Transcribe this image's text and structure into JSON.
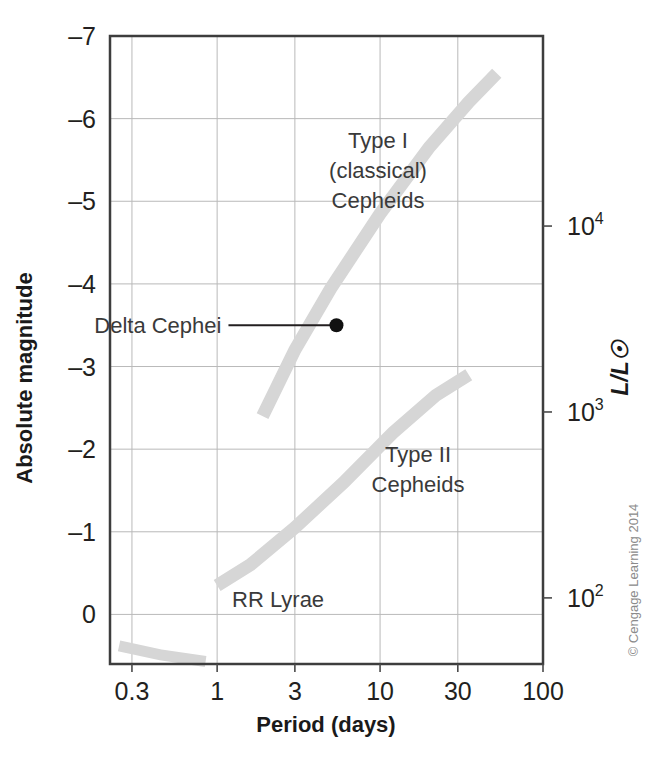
{
  "figure": {
    "credit": "© Cengage Learning 2014"
  },
  "chart_data": {
    "type": "line",
    "title": "",
    "xlabel": "Period (days)",
    "ylabel": "Absolute magnitude",
    "y2label": "L/L☉",
    "xscale": "log",
    "xlim": [
      0.22,
      100
    ],
    "ylim": [
      0.6,
      -7
    ],
    "grid": true,
    "legend_position": "inline-annotations",
    "xticks": [
      "0.3",
      "1",
      "3",
      "10",
      "30",
      "100"
    ],
    "xtick_values": [
      0.3,
      1,
      3,
      10,
      30,
      100
    ],
    "yticks": [
      "-7",
      "-6",
      "-5",
      "-4",
      "-3",
      "-2",
      "-1",
      "0"
    ],
    "ytick_values": [
      -7,
      -6,
      -5,
      -4,
      -3,
      -2,
      -1,
      0
    ],
    "y2ticks": [
      "10",
      "10",
      "10"
    ],
    "y2tick_exponents": [
      "4",
      "3",
      "2"
    ],
    "y2tick_values": [
      10000,
      1000,
      100
    ],
    "y2tick_magnitudes": [
      -4.7,
      -2.45,
      -0.2
    ],
    "series": [
      {
        "name": "Type I (classical) Cepheids",
        "annotation_lines": [
          "Type I",
          "(classical)",
          "Cepheids"
        ],
        "band": true,
        "period_range": [
          1.9,
          52
        ],
        "magnitude_range": [
          -2.4,
          -6.55
        ],
        "points": [
          {
            "period": 1.9,
            "magnitude": -2.4
          },
          {
            "period": 3.0,
            "magnitude": -3.2
          },
          {
            "period": 5.0,
            "magnitude": -3.95
          },
          {
            "period": 10.0,
            "magnitude": -4.85
          },
          {
            "period": 20.0,
            "magnitude": -5.65
          },
          {
            "period": 35.0,
            "magnitude": -6.2
          },
          {
            "period": 52.0,
            "magnitude": -6.55
          }
        ]
      },
      {
        "name": "Type II Cepheids",
        "annotation_lines": [
          "Type II",
          "Cepheids"
        ],
        "band": true,
        "period_range": [
          1.0,
          35
        ],
        "magnitude_range": [
          -0.35,
          -2.9
        ],
        "points": [
          {
            "period": 1.0,
            "magnitude": -0.35
          },
          {
            "period": 1.6,
            "magnitude": -0.6
          },
          {
            "period": 3.0,
            "magnitude": -1.05
          },
          {
            "period": 6.0,
            "magnitude": -1.6
          },
          {
            "period": 12.0,
            "magnitude": -2.2
          },
          {
            "period": 22.0,
            "magnitude": -2.65
          },
          {
            "period": 35.0,
            "magnitude": -2.9
          }
        ]
      },
      {
        "name": "RR Lyrae",
        "annotation_lines": [
          "RR Lyrae"
        ],
        "band": true,
        "period_range": [
          0.25,
          0.85
        ],
        "magnitude_range": [
          0.35,
          0.55
        ],
        "points": [
          {
            "period": 0.25,
            "magnitude": 0.38
          },
          {
            "period": 0.45,
            "magnitude": 0.49
          },
          {
            "period": 0.85,
            "magnitude": 0.57
          }
        ]
      }
    ],
    "annotations": [
      {
        "name": "Delta Cephei",
        "label": "Delta Cephei",
        "period": 5.4,
        "magnitude": -3.5,
        "marker": "filled-circle"
      }
    ]
  }
}
